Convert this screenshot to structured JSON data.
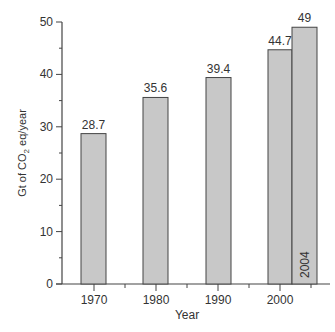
{
  "chart_data": {
    "type": "bar",
    "title": "",
    "xlabel": "Year",
    "ylabel": "Gt of CO2 eq/year",
    "ylabel_main": "Gt of CO",
    "ylabel_sub": "2",
    "ylabel_tail": " eq/year",
    "categories": [
      "1970",
      "1980",
      "1990",
      "2000",
      "2004"
    ],
    "values": [
      28.7,
      35.6,
      39.4,
      44.7,
      49
    ],
    "value_labels": [
      "28.7",
      "35.6",
      "39.4",
      "44.7",
      "49"
    ],
    "ylim": [
      0,
      50
    ],
    "yticks": [
      0,
      10,
      20,
      30,
      40,
      50
    ],
    "xtick_labels": [
      "1970",
      "1980",
      "1990",
      "2000"
    ],
    "inbar_label": "2004",
    "grid": false,
    "legend": null,
    "colors": {
      "bar_fill": "#c8c8c8",
      "bar_stroke": "#444444",
      "axis": "#444444"
    }
  }
}
